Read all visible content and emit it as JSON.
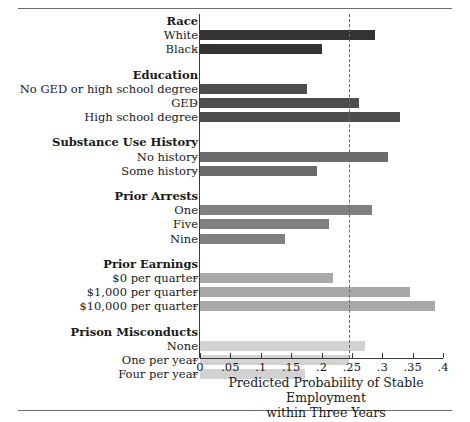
{
  "chart_data": {
    "type": "bar",
    "orientation": "horizontal",
    "title": "",
    "xlabel": "Predicted Probability of Stable Employment within Three Years",
    "xlabel_line1": "Predicted Probability of Stable Employment",
    "xlabel_line2": "within Three Years",
    "ylabel": "",
    "xlim": [
      0,
      0.4
    ],
    "grid": false,
    "legend": "none",
    "reference_line": 0.245,
    "tick_labels": [
      "0",
      ".05",
      ".1",
      ".15",
      ".2",
      ".25",
      ".3",
      ".35",
      ".4"
    ],
    "tick_values": [
      0,
      0.05,
      0.1,
      0.15,
      0.2,
      0.25,
      0.3,
      0.35,
      0.4
    ],
    "groups": [
      {
        "name": "Race",
        "color": "#333333",
        "categories": [
          "White",
          "Black"
        ],
        "values": [
          0.288,
          0.201
        ]
      },
      {
        "name": "Education",
        "color": "#4d4d4d",
        "categories": [
          "No GED or high school degree",
          "GED",
          "High school degree"
        ],
        "values": [
          0.176,
          0.262,
          0.329
        ]
      },
      {
        "name": "Substance Use History",
        "color": "#6b6b6b",
        "categories": [
          "No history",
          "Some history"
        ],
        "values": [
          0.309,
          0.192
        ]
      },
      {
        "name": "Prior Arrests",
        "color": "#808080",
        "categories": [
          "One",
          "Five",
          "Nine"
        ],
        "values": [
          0.283,
          0.212,
          0.14
        ]
      },
      {
        "name": "Prior Earnings",
        "color": "#a8a8a8",
        "categories": [
          "$0 per quarter",
          "$1,000 per quarter",
          "$10,000 per quarter"
        ],
        "values": [
          0.219,
          0.345,
          0.387
        ]
      },
      {
        "name": "Prison Misconducts",
        "color": "#d2d2d2",
        "categories": [
          "None",
          "One per year",
          "Four per year"
        ],
        "values": [
          0.271,
          0.245,
          0.173
        ]
      }
    ]
  },
  "axis": {
    "title_line1": "Predicted Probability of Stable Employment",
    "title_line2": "within Three Years"
  }
}
